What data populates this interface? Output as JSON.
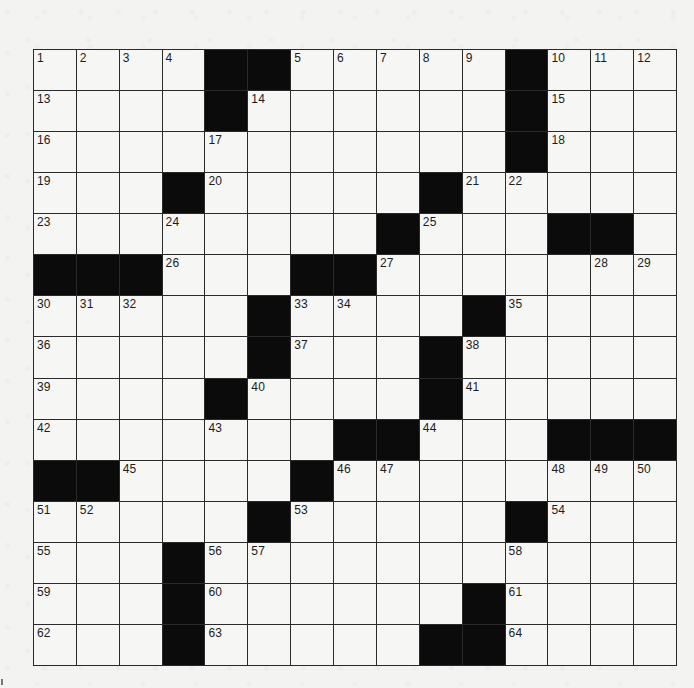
{
  "puzzle": {
    "rows": 15,
    "cols": 15,
    "colors": {
      "black_square": "#0b0b0b",
      "white_square": "#f6f6f4",
      "grid_line": "#2a2a2a",
      "page_background": "#f3f3f1"
    },
    "layout": [
      "....##.....#...",
      "....#......#...",
      "...........#...",
      "...#.....#.....",
      "........#...##.",
      "###...##.......",
      ".....#....#....",
      ".....#...#.....",
      "....#....#.....",
      ".......##...###",
      "##....#........",
      ".....#.....#...",
      "...#...........",
      "...#......#....",
      "...#.....##...."
    ],
    "numbers": [
      [
        1,
        2,
        3,
        4,
        null,
        null,
        5,
        6,
        7,
        8,
        9,
        null,
        10,
        11,
        12
      ],
      [
        13,
        null,
        null,
        null,
        null,
        14,
        null,
        null,
        null,
        null,
        null,
        null,
        15,
        null,
        null
      ],
      [
        16,
        null,
        null,
        null,
        17,
        null,
        null,
        null,
        null,
        null,
        null,
        null,
        18,
        null,
        null
      ],
      [
        19,
        null,
        null,
        null,
        20,
        null,
        null,
        null,
        null,
        null,
        21,
        22,
        null,
        null,
        null
      ],
      [
        23,
        null,
        null,
        24,
        null,
        null,
        null,
        null,
        null,
        25,
        null,
        null,
        null,
        null,
        null
      ],
      [
        null,
        null,
        null,
        26,
        null,
        null,
        null,
        null,
        27,
        null,
        null,
        null,
        null,
        28,
        29
      ],
      [
        30,
        31,
        32,
        null,
        null,
        null,
        33,
        34,
        null,
        null,
        null,
        35,
        null,
        null,
        null
      ],
      [
        36,
        null,
        null,
        null,
        null,
        null,
        37,
        null,
        null,
        null,
        38,
        null,
        null,
        null,
        null
      ],
      [
        39,
        null,
        null,
        null,
        null,
        40,
        null,
        null,
        null,
        null,
        41,
        null,
        null,
        null,
        null
      ],
      [
        42,
        null,
        null,
        null,
        43,
        null,
        null,
        null,
        null,
        44,
        null,
        null,
        null,
        null,
        null
      ],
      [
        null,
        null,
        45,
        null,
        null,
        null,
        null,
        46,
        47,
        null,
        null,
        null,
        48,
        49,
        50
      ],
      [
        51,
        52,
        null,
        null,
        null,
        null,
        53,
        null,
        null,
        null,
        null,
        null,
        54,
        null,
        null
      ],
      [
        55,
        null,
        null,
        null,
        56,
        57,
        null,
        null,
        null,
        null,
        null,
        58,
        null,
        null,
        null
      ],
      [
        59,
        null,
        null,
        null,
        60,
        null,
        null,
        null,
        null,
        null,
        null,
        61,
        null,
        null,
        null
      ],
      [
        62,
        null,
        null,
        null,
        63,
        null,
        null,
        null,
        null,
        null,
        null,
        64,
        null,
        null,
        null
      ]
    ]
  }
}
